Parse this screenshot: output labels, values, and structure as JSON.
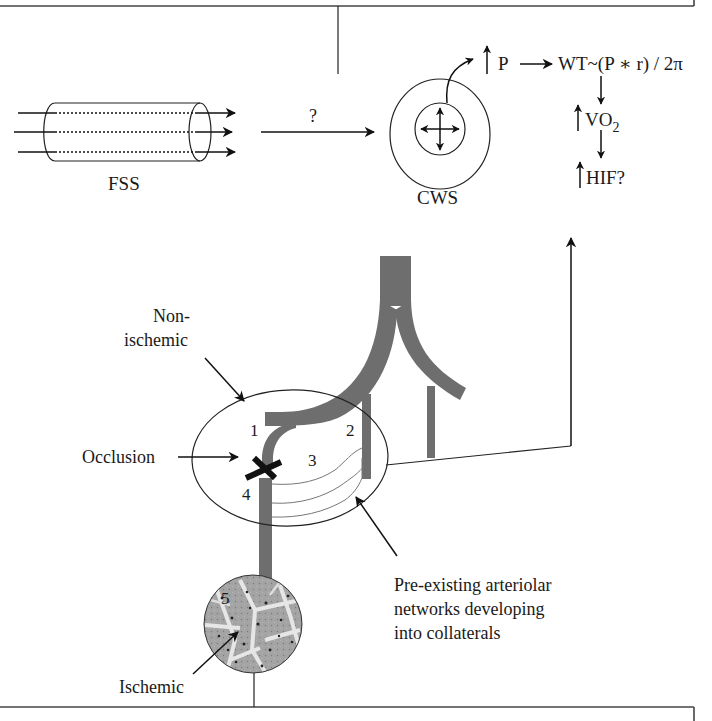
{
  "top_panel": {
    "fss_label": "FSS",
    "question_mark": "?",
    "cws_label": "CWS",
    "pressure_label": "P",
    "wall_tension_formula": "WT~(P ∗ r) / 2π",
    "vo2_label": "VO",
    "vo2_subscript": "2",
    "hif_label": "HIF?"
  },
  "lower_panel": {
    "non_ischemic_line1": "Non-",
    "non_ischemic_line2": "ischemic",
    "occlusion_label": "Occlusion",
    "ischemic_label": "Ischemic",
    "collateral_caption": {
      "line1": "Pre-existing arteriolar",
      "line2": "networks developing",
      "line3": "into collaterals"
    },
    "site_numbers": [
      "1",
      "2",
      "3",
      "4",
      "5"
    ]
  },
  "colors": {
    "vessel_gray": "#6e6e6e",
    "line": "#222222",
    "frame": "#444444",
    "tissue_base": "#9a9a9a",
    "tissue_light": "#e6e6e6"
  },
  "icons": {
    "occlusion_marker": "x-cross-icon",
    "increase_marker": "up-arrow-icon",
    "flow_direction": "right-arrow-icon",
    "radial_stretch": "four-way-arrow-icon"
  }
}
